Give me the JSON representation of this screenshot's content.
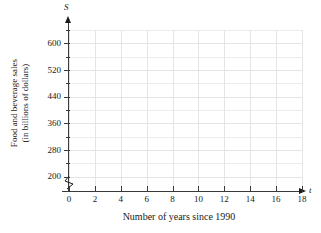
{
  "chart_data": {
    "type": "line",
    "title": "",
    "subtitle": "",
    "xlabel": "Number of years since 1990",
    "ylabel": "Food and beverage sales (in billions of dollars)",
    "ylabel_line1": "Food and beverage sales",
    "ylabel_line2": "(in billions of dollars)",
    "x_variable": "t",
    "y_variable": "S",
    "xticks": [
      0,
      2,
      4,
      6,
      8,
      10,
      12,
      14,
      16,
      18
    ],
    "xtick_labels": [
      "0",
      "2",
      "4",
      "6",
      "8",
      "10",
      "12",
      "14",
      "16",
      "18"
    ],
    "yticks": [
      200,
      280,
      360,
      440,
      520,
      600
    ],
    "ytick_labels": [
      "200",
      "280",
      "360",
      "440",
      "520",
      "600"
    ],
    "y_minor_ticks": [
      240,
      320,
      400,
      480,
      560,
      640
    ],
    "xlim": [
      0,
      18
    ],
    "ylim": [
      160,
      640
    ],
    "grid": true,
    "grid_color": "#ececec",
    "axis_color": "#3a3a3a",
    "axis_break_y": true,
    "legend": null,
    "legend_position": "none",
    "series": [
      {
        "name": "",
        "x": [],
        "values": []
      }
    ],
    "annotations": [],
    "note": "Empty coordinate grid with no plotted data points or curves"
  },
  "axes": {
    "y_variable_label": "S",
    "x_variable_label": "t"
  }
}
